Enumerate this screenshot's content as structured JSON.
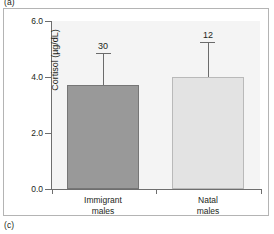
{
  "figure": {
    "panel_letter_top": "(a)",
    "panel_letter_bottom": "(c)"
  },
  "chart_data": {
    "type": "bar",
    "title": "",
    "xlabel": "",
    "ylabel": "Cortisol (µg/dL)",
    "categories": [
      "Immigrant males",
      "Natal males"
    ],
    "category_lines": [
      [
        "Immigrant",
        "males"
      ],
      [
        "Natal",
        "males"
      ]
    ],
    "values": [
      3.7,
      4.0
    ],
    "errors_upper": [
      1.15,
      1.25
    ],
    "error_upper_values": [
      4.85,
      5.25
    ],
    "sample_size_labels": [
      "30",
      "12"
    ],
    "ylim": [
      0.0,
      6.0
    ],
    "yticks": [
      "0.0",
      "2.0",
      "4.0",
      "6.0"
    ],
    "ytick_values": [
      0.0,
      2.0,
      4.0,
      6.0
    ],
    "grid": false,
    "legend": "none",
    "bar_colors": [
      "#999999",
      "#e3e3e3"
    ],
    "bar_edge_colors": [
      "#767676",
      "#b9b9b9"
    ],
    "plot_background": "#f4f4f4",
    "axis_color": "#6e6e6e",
    "error_bar_color": "#6b6b6b"
  }
}
